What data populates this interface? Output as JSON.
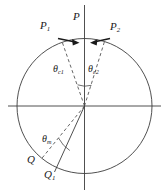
{
  "figure": {
    "type": "geometry-diagram",
    "background_color": "#ffffff",
    "stroke_color": "#3c3c3c",
    "label_color": "#1a1a1a",
    "geometry": {
      "center": {
        "x": 84.5,
        "y": 106
      },
      "radius": 67.5,
      "horizontal_axis": {
        "x1": 8,
        "y1": 106,
        "x2": 161,
        "y2": 106
      },
      "vertical_axis": {
        "x1": 84.5,
        "y1": 5,
        "x2": 84.5,
        "y2": 190
      },
      "dashed_rays": [
        {
          "name": "ray-theta-c1",
          "angle_deg_from_vertical": -19,
          "endpoint": {
            "x": 62,
            "y": 42
          }
        },
        {
          "name": "ray-theta-c2",
          "angle_deg_from_vertical": 17,
          "endpoint": {
            "x": 104,
            "y": 42
          }
        },
        {
          "name": "ray-theta-m",
          "angle_deg_from_vertical": -142,
          "endpoint": {
            "x": 41,
            "y": 160
          }
        }
      ],
      "solid_rays": [
        {
          "name": "ray-q1",
          "endpoint": {
            "x": 55,
            "y": 172
          }
        }
      ],
      "arcs": [
        {
          "name": "arc-theta-c-apex",
          "radius": 22
        },
        {
          "name": "arc-theta-m",
          "radius": 34
        }
      ]
    },
    "labels": {
      "p_left": {
        "base": "P",
        "sub": "1"
      },
      "p_center": {
        "base": "P",
        "sub": ""
      },
      "p_right": {
        "base": "P",
        "sub": "2"
      },
      "theta_c1": {
        "base": "θ",
        "sub": "c1"
      },
      "theta_c2": {
        "base": "θ",
        "sub": "c2"
      },
      "theta_m": {
        "base": "θ",
        "sub": "m"
      },
      "q": {
        "base": "Q",
        "sub": ""
      },
      "q1": {
        "base": "Q",
        "sub": "1"
      }
    },
    "arrows": [
      {
        "name": "arrow-p1",
        "direction": "right",
        "from": {
          "x": 60,
          "y": 39
        },
        "to": {
          "x": 78,
          "y": 42
        }
      },
      {
        "name": "arrow-p2",
        "direction": "left",
        "from": {
          "x": 108,
          "y": 40
        },
        "to": {
          "x": 92,
          "y": 42
        }
      }
    ]
  }
}
